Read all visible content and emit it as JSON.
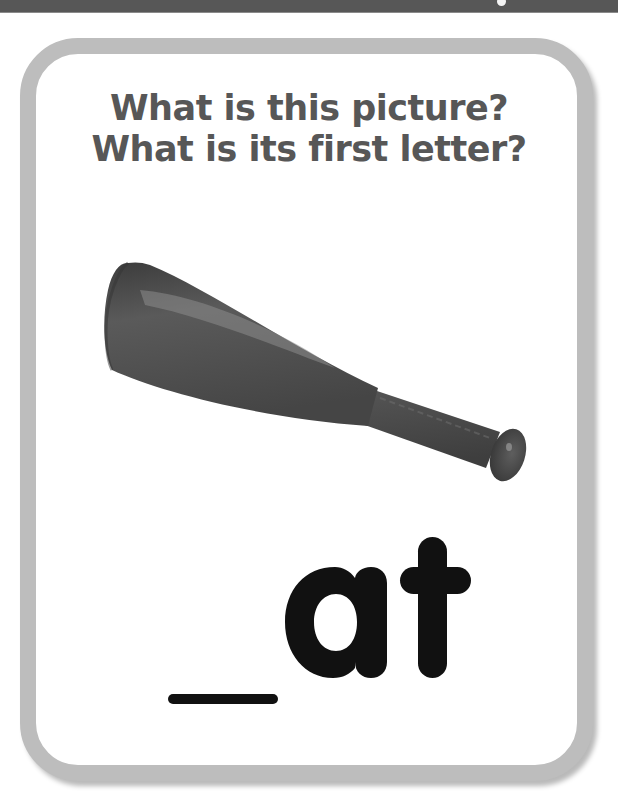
{
  "card": {
    "prompt_lines": [
      "What is this picture?",
      "What is its first letter?"
    ],
    "picture": {
      "subject": "bat",
      "icon": "baseball-bat-icon"
    },
    "word": {
      "blank": "_",
      "ending": "at"
    }
  },
  "colors": {
    "top_bar": "#575757",
    "card_border": "#bdbdbd",
    "prompt_text": "#575757",
    "word_text": "#111111",
    "bat": "#4f4f4f"
  }
}
